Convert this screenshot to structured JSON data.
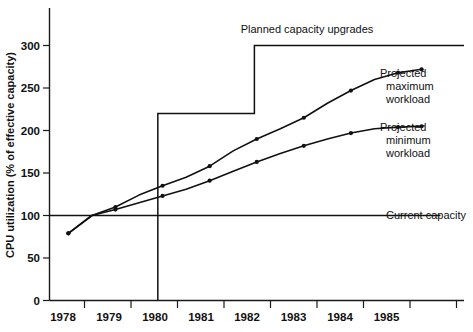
{
  "chart_data": {
    "type": "line",
    "title": "",
    "xlabel": "",
    "ylabel": "CPU utilization (% of effective capacity)",
    "xlim": [
      1977.6,
      1986.4
    ],
    "ylim": [
      0,
      320
    ],
    "yticks": [
      0,
      50,
      100,
      150,
      200,
      250,
      300
    ],
    "ytick_labels": [
      "0",
      "50",
      "100",
      "150",
      "200",
      "250",
      "300"
    ],
    "xticks": [
      1978,
      1979,
      1980,
      1981,
      1982,
      1983,
      1984,
      1985
    ],
    "xtick_labels": [
      "1978",
      "1979",
      "1980",
      "1981",
      "1982",
      "1983",
      "1984",
      "1985"
    ],
    "grid": false,
    "legend_position": "inline-right-annotations",
    "series": [
      {
        "name": "Projected maximum workload",
        "x": [
          1978.0,
          1978.5,
          1979.0,
          1979.5,
          1980.0,
          1980.5,
          1981.0,
          1981.5,
          1982.0,
          1982.5,
          1983.0,
          1983.5,
          1984.0,
          1984.5,
          1985.0,
          1985.5
        ],
        "y": [
          79,
          100,
          110,
          124,
          135,
          145,
          158,
          176,
          190,
          202,
          215,
          232,
          247,
          260,
          268,
          272
        ]
      },
      {
        "name": "Projected minimum workload",
        "x": [
          1978.0,
          1978.5,
          1979.0,
          1979.5,
          1980.0,
          1980.5,
          1981.0,
          1981.5,
          1982.0,
          1982.5,
          1983.0,
          1983.5,
          1984.0,
          1984.5,
          1985.0,
          1985.5
        ],
        "y": [
          79,
          100,
          107,
          115,
          123,
          131,
          141,
          152,
          163,
          173,
          182,
          190,
          197,
          202,
          204,
          205
        ]
      }
    ],
    "step_series": {
      "name": "Planned capacity upgrades",
      "points": [
        {
          "x": 1979.9,
          "y": 0
        },
        {
          "x": 1979.9,
          "y": 220
        },
        {
          "x": 1981.95,
          "y": 220
        },
        {
          "x": 1981.95,
          "y": 300
        },
        {
          "x": 1986.4,
          "y": 300
        }
      ]
    },
    "reference_line": {
      "name": "Current capacity",
      "y": 100,
      "x_start": 1977.6,
      "x_end": 1985.9
    },
    "annotations": [
      {
        "id": "planned-capacity-upgrades",
        "text": "Planned capacity upgrades"
      },
      {
        "id": "projected-maximum-workload",
        "lines": [
          "Projected",
          "maximum",
          "workload"
        ]
      },
      {
        "id": "projected-minimum-workload",
        "lines": [
          "Projected",
          "minimum",
          "workload"
        ]
      },
      {
        "id": "current-capacity",
        "text": "Current capacity"
      }
    ]
  },
  "labels": {
    "y_axis_title": "CPU utilization (% of effective capacity)",
    "planned_capacity_upgrades": "Planned capacity upgrades",
    "projected_max_line1": "Projected",
    "projected_max_line2": "maximum",
    "projected_max_line3": "workload",
    "projected_min_line1": "Projected",
    "projected_min_line2": "minimum",
    "projected_min_line3": "workload",
    "current_capacity": "Current capacity",
    "y0": "0",
    "y50": "50",
    "y100": "100",
    "y150": "150",
    "y200": "200",
    "y250": "250",
    "y300": "300",
    "x1978": "1978",
    "x1979": "1979",
    "x1980": "1980",
    "x1981": "1981",
    "x1982": "1982",
    "x1983": "1983",
    "x1984": "1984",
    "x1985": "1985"
  },
  "colors": {
    "ink": "#111111",
    "background": "#ffffff"
  }
}
